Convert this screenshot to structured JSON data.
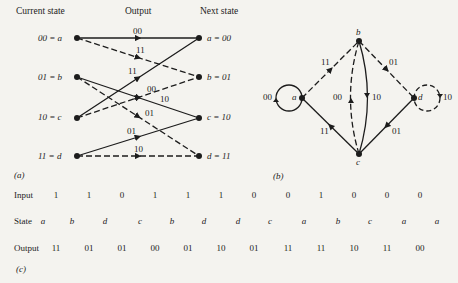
{
  "trellis": {
    "headers": {
      "current": "Current state",
      "output": "Output",
      "next": "Next state"
    },
    "left_states": [
      "00 = a",
      "01 = b",
      "10 = c",
      "11 = d"
    ],
    "right_states": [
      "a = 00",
      "b = 01",
      "c = 10",
      "d = 11"
    ],
    "edges": [
      {
        "from": "a",
        "to": "a",
        "output": "00",
        "style": "solid"
      },
      {
        "from": "a",
        "to": "b",
        "output": "11",
        "style": "dashed"
      },
      {
        "from": "b",
        "to": "c",
        "output": "10",
        "style": "solid"
      },
      {
        "from": "b",
        "to": "d",
        "output": "01",
        "style": "dashed"
      },
      {
        "from": "c",
        "to": "a",
        "output": "11",
        "style": "solid"
      },
      {
        "from": "c",
        "to": "b",
        "output": "00",
        "style": "dashed"
      },
      {
        "from": "d",
        "to": "c",
        "output": "01",
        "style": "solid"
      },
      {
        "from": "d",
        "to": "d",
        "output": "10",
        "style": "dashed"
      }
    ],
    "caption": "(a)"
  },
  "state_diagram": {
    "nodes": [
      "a",
      "b",
      "c",
      "d"
    ],
    "edge_labels": {
      "a_self": "00",
      "a_to_b": "11",
      "b_to_d": "01",
      "c_to_b": "00",
      "b_to_c": "10",
      "c_to_a": "11",
      "d_to_c": "01",
      "d_self": "10"
    },
    "caption": "(b)"
  },
  "sequence": {
    "input_label": "Input",
    "state_label": "State",
    "output_label": "Output",
    "inputs": [
      "1",
      "1",
      "0",
      "1",
      "1",
      "1",
      "0",
      "0",
      "1",
      "0",
      "0",
      "0"
    ],
    "states": [
      "a",
      "b",
      "d",
      "c",
      "b",
      "d",
      "d",
      "c",
      "a",
      "b",
      "c",
      "a",
      "a"
    ],
    "outputs": [
      "11",
      "01",
      "01",
      "00",
      "01",
      "10",
      "01",
      "11",
      "11",
      "10",
      "11",
      "00"
    ],
    "caption": "(c)"
  }
}
